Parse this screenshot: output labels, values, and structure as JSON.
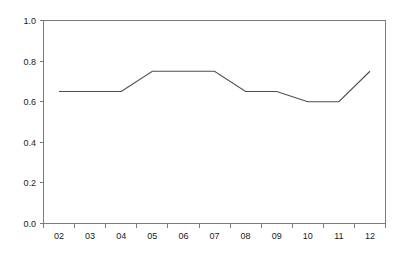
{
  "chart_data": {
    "type": "line",
    "title": "",
    "subtitle": "",
    "xlabel": "",
    "ylabel": "",
    "categories": [
      "02",
      "03",
      "04",
      "05",
      "06",
      "07",
      "08",
      "09",
      "10",
      "11",
      "12"
    ],
    "values": [
      0.65,
      0.65,
      0.65,
      0.75,
      0.75,
      0.75,
      0.65,
      0.65,
      0.6,
      0.6,
      0.75
    ],
    "series": [
      {
        "name": "series-1",
        "values": [
          0.65,
          0.65,
          0.65,
          0.75,
          0.75,
          0.75,
          0.65,
          0.65,
          0.6,
          0.6,
          0.75
        ],
        "color": "#4d4d4d"
      }
    ],
    "ylim": [
      0.0,
      1.0
    ],
    "ytick_labels": [
      "0.0",
      "0.2",
      "0.4",
      "0.6",
      "0.8",
      "1.0"
    ],
    "ytick_values": [
      0.0,
      0.2,
      0.4,
      0.6,
      0.8,
      1.0
    ],
    "xtick_labels": [
      "02",
      "03",
      "04",
      "05",
      "06",
      "07",
      "08",
      "09",
      "10",
      "11",
      "12"
    ],
    "grid": false,
    "legend": false,
    "legend_position": "none",
    "annotations": [],
    "frame": "box",
    "axis_color": "#7a7a7a",
    "background_color": "#ffffff"
  },
  "axes": {
    "y_labels": [
      "1.0",
      "0.8",
      "0.6",
      "0.4",
      "0.2",
      "0.0"
    ],
    "x_labels": [
      "02",
      "03",
      "04",
      "05",
      "06",
      "07",
      "08",
      "09",
      "10",
      "11",
      "12"
    ]
  }
}
